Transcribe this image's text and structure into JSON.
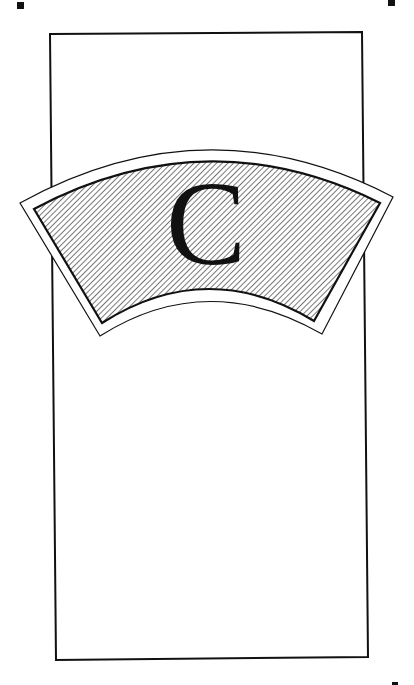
{
  "page": {
    "letter": "C",
    "colors": {
      "ink": "#111111",
      "paper": "#ffffff",
      "hatch": "#555555"
    },
    "marks": [
      "top-left",
      "top-right",
      "bottom-right"
    ]
  }
}
